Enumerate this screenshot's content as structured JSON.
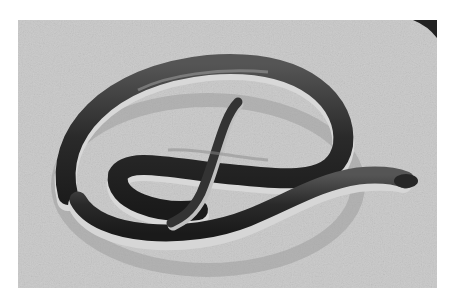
{
  "image": {
    "subject": "Coiled snake on a concrete surface",
    "style": "Black-and-white photograph",
    "colors": {
      "background": "#ffffff",
      "ground": "#c9c9c9",
      "snake_dark": "#2a2a2a",
      "snake_belly": "#d8d8d8"
    }
  }
}
